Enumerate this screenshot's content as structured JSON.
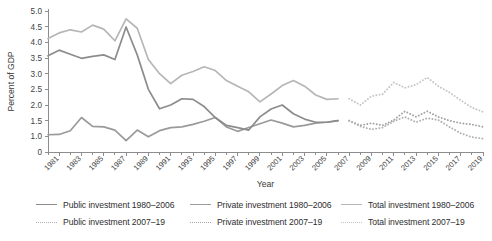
{
  "chart_data": {
    "type": "line",
    "title": "",
    "xlabel": "Year",
    "ylabel": "Percent of GDP",
    "ylim": [
      0,
      5.0
    ],
    "xlim": [
      1980,
      2019
    ],
    "grid": false,
    "legend_position": "bottom",
    "ytick_labels": [
      "5.0",
      "4.5",
      "4.0",
      "3.5",
      "3.0",
      "2.5",
      "2.0",
      "1.5",
      "1.0",
      "0"
    ],
    "ytick_values": [
      5.0,
      4.5,
      4.0,
      3.5,
      3.0,
      2.5,
      2.0,
      1.5,
      1.0,
      0.0
    ],
    "xtick_labels": [
      "1981",
      "1983",
      "1985",
      "1987",
      "1989",
      "1991",
      "1993",
      "1995",
      "1997",
      "1999",
      "2001",
      "2003",
      "2005",
      "2007",
      "2009",
      "2011",
      "2013",
      "2015",
      "2017",
      "2019"
    ],
    "xtick_values": [
      1981,
      1983,
      1985,
      1987,
      1989,
      1991,
      1993,
      1995,
      1997,
      1999,
      2001,
      2003,
      2005,
      2007,
      2009,
      2011,
      2013,
      2015,
      2017,
      2019
    ],
    "colors": {
      "public": "#8c8c8c",
      "private": "#9a9a9a",
      "total": "#b6b6b6",
      "axis": "#8d8d8d",
      "text": "#3a3a3a"
    },
    "series": [
      {
        "name": "Public investment 1980–2006",
        "key": "public_hist",
        "style": "solid",
        "color": "#8c8c8c",
        "x": [
          1980,
          1981,
          1982,
          1983,
          1984,
          1985,
          1986,
          1987,
          1988,
          1989,
          1990,
          1991,
          1992,
          1993,
          1994,
          1995,
          1996,
          1997,
          1998,
          1999,
          2000,
          2001,
          2002,
          2003,
          2004,
          2005,
          2006
        ],
        "values": [
          3.57,
          3.75,
          3.62,
          3.49,
          3.55,
          3.6,
          3.45,
          4.49,
          3.6,
          2.5,
          1.88,
          2.0,
          2.2,
          2.18,
          1.95,
          1.6,
          1.35,
          1.28,
          1.2,
          1.62,
          1.87,
          2.0,
          1.72,
          1.55,
          1.45,
          1.45,
          1.5
        ]
      },
      {
        "name": "Private investment 1980–2006",
        "key": "private_hist",
        "style": "solid",
        "color": "#9a9a9a",
        "x": [
          1980,
          1981,
          1982,
          1983,
          1984,
          1985,
          1986,
          1987,
          1988,
          1989,
          1990,
          1991,
          1992,
          1993,
          1994,
          1995,
          1996,
          1997,
          1998,
          1999,
          2000,
          2001,
          2002,
          2003,
          2004,
          2005,
          2006
        ],
        "values": [
          1.05,
          1.06,
          1.18,
          1.6,
          1.32,
          1.3,
          1.2,
          0.72,
          1.2,
          0.97,
          1.18,
          1.28,
          1.3,
          1.38,
          1.48,
          1.6,
          1.3,
          1.16,
          1.28,
          1.4,
          1.52,
          1.42,
          1.3,
          1.35,
          1.42,
          1.45,
          1.5
        ]
      },
      {
        "name": "Total investment 1980–2006",
        "key": "total_hist",
        "style": "solid",
        "color": "#b6b6b6",
        "x": [
          1980,
          1981,
          1982,
          1983,
          1984,
          1985,
          1986,
          1987,
          1988,
          1989,
          1990,
          1991,
          1992,
          1993,
          1994,
          1995,
          1996,
          1997,
          1998,
          1999,
          2000,
          2001,
          2002,
          2003,
          2004,
          2005,
          2006
        ],
        "values": [
          4.12,
          4.3,
          4.4,
          4.33,
          4.55,
          4.42,
          4.05,
          4.75,
          4.45,
          3.45,
          3.0,
          2.68,
          2.95,
          3.07,
          3.22,
          3.1,
          2.78,
          2.6,
          2.42,
          2.1,
          2.35,
          2.62,
          2.78,
          2.6,
          2.32,
          2.18,
          2.2
        ]
      },
      {
        "name": "Public investment 2007–19",
        "key": "public_proj",
        "style": "dotted",
        "color": "#b0b0b0",
        "x": [
          2007,
          2008,
          2009,
          2010,
          2011,
          2012,
          2013,
          2014,
          2015,
          2016,
          2017,
          2018,
          2019
        ],
        "values": [
          1.5,
          1.32,
          1.22,
          1.28,
          1.48,
          1.62,
          1.45,
          1.58,
          1.52,
          1.3,
          1.1,
          0.95,
          0.85
        ]
      },
      {
        "name": "Private investment 2007–19",
        "key": "private_proj",
        "style": "dotted",
        "color": "#a3a3a3",
        "x": [
          2007,
          2008,
          2009,
          2010,
          2011,
          2012,
          2013,
          2014,
          2015,
          2016,
          2017,
          2018,
          2019
        ],
        "values": [
          1.5,
          1.35,
          1.42,
          1.35,
          1.52,
          1.8,
          1.62,
          1.8,
          1.62,
          1.5,
          1.42,
          1.38,
          1.3
        ]
      },
      {
        "name": "Total investment 2007–19",
        "key": "total_proj",
        "style": "dotted",
        "color": "#c4c4c4",
        "x": [
          2007,
          2008,
          2009,
          2010,
          2011,
          2012,
          2013,
          2014,
          2015,
          2016,
          2017,
          2018,
          2019
        ],
        "values": [
          2.2,
          2.0,
          2.28,
          2.35,
          2.72,
          2.55,
          2.65,
          2.88,
          2.6,
          2.4,
          2.15,
          1.92,
          1.78
        ]
      }
    ]
  },
  "axes": {
    "ylabel": "Percent of GDP",
    "xlabel": "Year"
  },
  "legend": {
    "rows": [
      [
        {
          "label": "Public investment 1980–2006",
          "style": "solid",
          "color": "#8c8c8c"
        },
        {
          "label": "Private investment 1980–2006",
          "style": "solid",
          "color": "#9a9a9a"
        },
        {
          "label": "Total investment 1980–2006",
          "style": "solid",
          "color": "#b6b6b6"
        }
      ],
      [
        {
          "label": "Public investment 2007–19",
          "style": "dotted",
          "color": "#b0b0b0"
        },
        {
          "label": "Private investment 2007–19",
          "style": "dotted",
          "color": "#a3a3a3"
        },
        {
          "label": "Total investment 2007–19",
          "style": "dotted",
          "color": "#c4c4c4"
        }
      ]
    ]
  }
}
